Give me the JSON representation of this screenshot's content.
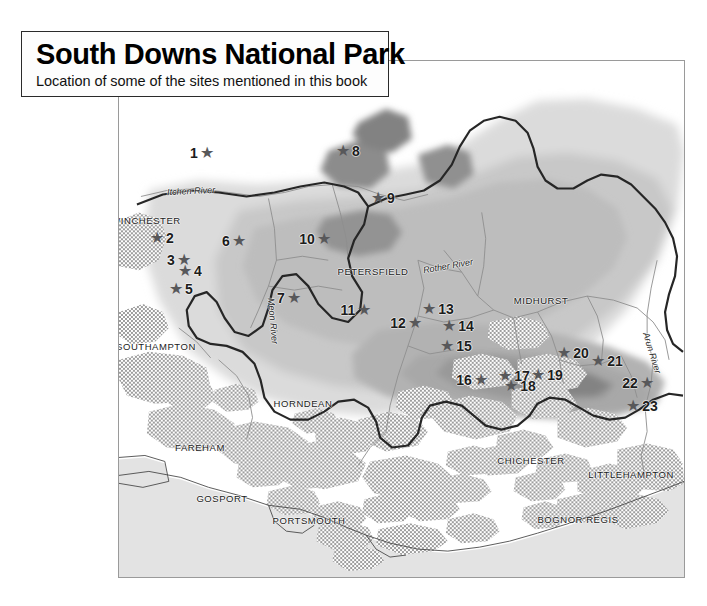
{
  "title": {
    "main": "South Downs National Park",
    "subtitle": "Location of some of the sites mentioned in this book"
  },
  "map": {
    "type": "thematic-relief-map",
    "region": "South Downs National Park, southern England",
    "star_glyph": "★",
    "colors": {
      "sea": "#e3e3e3",
      "land": "#ffffff",
      "lowland": "#d8d8d8",
      "midland": "#c0c0c0",
      "upland": "#a6a6a6",
      "highland": "#8c8c8c",
      "urban": "#a8a8a8",
      "park_boundary": "#262626",
      "star": "#58585a",
      "frame": "#9a9a9a",
      "label": "#1c1c1c"
    },
    "frame": {
      "x": 118,
      "y": 60,
      "width": 567,
      "height": 518
    }
  },
  "sites": [
    {
      "number": "1",
      "x": 201,
      "y": 152,
      "side": "num-left"
    },
    {
      "number": "2",
      "x": 161,
      "y": 237,
      "side": "num-right"
    },
    {
      "number": "3",
      "x": 178,
      "y": 259,
      "side": "num-left"
    },
    {
      "number": "4",
      "x": 189,
      "y": 270,
      "side": "num-right"
    },
    {
      "number": "5",
      "x": 180,
      "y": 288,
      "side": "num-right"
    },
    {
      "number": "6",
      "x": 233,
      "y": 240,
      "side": "num-left"
    },
    {
      "number": "7",
      "x": 288,
      "y": 297,
      "side": "num-left"
    },
    {
      "number": "8",
      "x": 347,
      "y": 150,
      "side": "num-right"
    },
    {
      "number": "9",
      "x": 382,
      "y": 197,
      "side": "num-right"
    },
    {
      "number": "10",
      "x": 314,
      "y": 238,
      "side": "num-left"
    },
    {
      "number": "11",
      "x": 355,
      "y": 309,
      "side": "num-left"
    },
    {
      "number": "12",
      "x": 405,
      "y": 322,
      "side": "num-left"
    },
    {
      "number": "13",
      "x": 437,
      "y": 308,
      "side": "num-right"
    },
    {
      "number": "14",
      "x": 457,
      "y": 325,
      "side": "num-right"
    },
    {
      "number": "15",
      "x": 455,
      "y": 345,
      "side": "num-right"
    },
    {
      "number": "16",
      "x": 471,
      "y": 379,
      "side": "num-left"
    },
    {
      "number": "17",
      "x": 513,
      "y": 375,
      "side": "num-right"
    },
    {
      "number": "18",
      "x": 519,
      "y": 385,
      "side": "num-right"
    },
    {
      "number": "19",
      "x": 546,
      "y": 374,
      "side": "num-right"
    },
    {
      "number": "20",
      "x": 572,
      "y": 352,
      "side": "num-right"
    },
    {
      "number": "21",
      "x": 606,
      "y": 360,
      "side": "num-right"
    },
    {
      "number": "22",
      "x": 637,
      "y": 382,
      "side": "num-left"
    },
    {
      "number": "23",
      "x": 641,
      "y": 405,
      "side": "num-right"
    }
  ],
  "places": [
    {
      "name": "WINCHESTER",
      "x": 145,
      "y": 219
    },
    {
      "name": "PETERSFIELD",
      "x": 372,
      "y": 270
    },
    {
      "name": "MIDHURST",
      "x": 540,
      "y": 299
    },
    {
      "name": "SOUTHAMPTON",
      "x": 155,
      "y": 345
    },
    {
      "name": "HORNDEAN",
      "x": 302,
      "y": 402
    },
    {
      "name": "FAREHAM",
      "x": 199,
      "y": 446
    },
    {
      "name": "GOSPORT",
      "x": 221,
      "y": 497
    },
    {
      "name": "PORTSMOUTH",
      "x": 308,
      "y": 519
    },
    {
      "name": "CHICHESTER",
      "x": 530,
      "y": 459
    },
    {
      "name": "LITTLEHAMPTON",
      "x": 630,
      "y": 473
    },
    {
      "name": "BOGNOR REGIS",
      "x": 577,
      "y": 518
    }
  ],
  "rivers": [
    {
      "name": "Itchen River",
      "x": 190,
      "y": 190,
      "rotation": -3
    },
    {
      "name": "Meon River",
      "x": 272,
      "y": 320,
      "rotation": 85
    },
    {
      "name": "Rother River",
      "x": 447,
      "y": 265,
      "rotation": -10
    },
    {
      "name": "Arun River",
      "x": 651,
      "y": 352,
      "rotation": 73
    }
  ]
}
